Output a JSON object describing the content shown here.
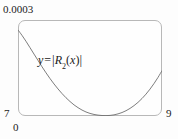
{
  "chart_data": {
    "type": "line",
    "title": "",
    "xlabel": "",
    "ylabel": "",
    "xlim": [
      0,
      9
    ],
    "ylim": [
      7,
      0.0003
    ],
    "grid": false,
    "legend": null,
    "annotations": [
      {
        "text": "y = |R2(x)|",
        "lhs": "y",
        "operator": "=",
        "bar_left": "|",
        "function_name": "R",
        "subscript": "2",
        "paren_open": "(",
        "variable": "x",
        "paren_close": ")",
        "bar_right": "|"
      }
    ],
    "axis_tick_labels": {
      "y_top": "0.0003",
      "y_bottom": "7",
      "x_left": "0",
      "x_right": "9"
    },
    "series": [
      {
        "name": "|R2(x)|",
        "color": "#6e6e6e",
        "x": [
          0.0,
          0.25,
          0.5,
          0.75,
          1.0,
          1.25,
          1.5,
          1.75,
          2.0,
          2.25,
          2.5,
          2.75,
          3.0,
          3.25,
          3.5,
          3.75,
          4.0,
          4.25,
          4.5,
          4.75,
          5.0,
          5.25,
          5.5,
          5.75,
          6.0,
          6.25,
          6.5,
          6.75,
          7.0,
          7.25,
          7.5,
          7.75,
          8.0,
          8.25,
          8.5,
          8.75,
          9.0
        ],
        "y_pixel_fraction": [
          0.104,
          0.16,
          0.222,
          0.288,
          0.355,
          0.421,
          0.487,
          0.55,
          0.61,
          0.666,
          0.718,
          0.766,
          0.81,
          0.849,
          0.884,
          0.913,
          0.938,
          0.958,
          0.973,
          0.984,
          0.991,
          0.995,
          0.996,
          0.994,
          0.988,
          0.978,
          0.964,
          0.945,
          0.921,
          0.892,
          0.858,
          0.818,
          0.772,
          0.72,
          0.662,
          0.598,
          0.528
        ]
      }
    ]
  },
  "frame": {
    "stroke_color": "#b8b8b8",
    "background_color": "#fefefe",
    "corner_radius": 7
  },
  "canvas": {
    "background_color": "#fdfdfd",
    "width": 178,
    "height": 139
  }
}
